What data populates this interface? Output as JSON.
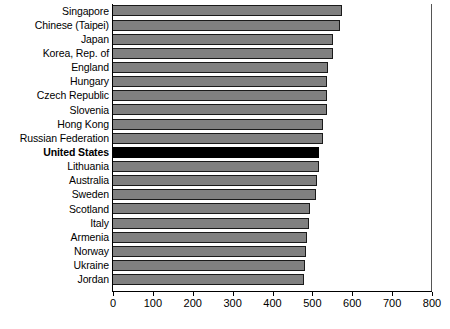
{
  "chart_data": {
    "type": "bar",
    "orientation": "horizontal",
    "title": "",
    "subtitle": "",
    "xlabel": "",
    "ylabel": "",
    "xlim": [
      0,
      800
    ],
    "xticks": [
      0,
      100,
      200,
      300,
      400,
      500,
      600,
      700,
      800
    ],
    "xtick_labels": [
      "0",
      "100",
      "200",
      "300",
      "400",
      "500",
      "600",
      "700",
      "800"
    ],
    "grid": false,
    "legend": null,
    "categories": [
      "Singapore",
      "Chinese (Taipei)",
      "Japan",
      "Korea, Rep. of",
      "England",
      "Hungary",
      "Czech Republic",
      "Slovenia",
      "Hong Kong",
      "Russian Federation",
      "United States",
      "Lithuania",
      "Australia",
      "Sweden",
      "Scotland",
      "Italy",
      "Armenia",
      "Norway",
      "Ukraine",
      "Jordan"
    ],
    "values": [
      578,
      571,
      554,
      553,
      542,
      539,
      539,
      538,
      530,
      530,
      520,
      519,
      515,
      511,
      496,
      495,
      488,
      487,
      485,
      482
    ],
    "highlight_category": "United States",
    "colors": {
      "bar_fill": "#808080",
      "bar_border": "#1a1a1a",
      "highlight_fill": "#000000",
      "axis": "#000000",
      "text": "#000000",
      "background": "#ffffff"
    }
  }
}
